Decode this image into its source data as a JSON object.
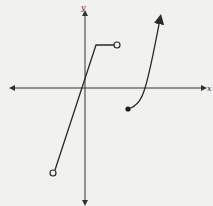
{
  "graph": {
    "axes": {
      "x_label": "x",
      "y_label": "y",
      "color": "#333333"
    },
    "curve_color": "#2a2a2a",
    "pieces": [
      {
        "name": "linear-segment",
        "description": "rising line from open circle (bottom-left) to corner, then horizontal segment ending at open circle",
        "start_point": {
          "type": "open",
          "px": [
            53,
            173
          ]
        },
        "corner_px": [
          96,
          45
        ],
        "end_point": {
          "type": "open",
          "px": [
            117,
            45
          ]
        }
      },
      {
        "name": "curve-segment",
        "description": "increasing curve starting at closed dot below x-axis, crossing x-axis, continuing upward with arrow",
        "start_point": {
          "type": "closed",
          "px": [
            128,
            109
          ]
        },
        "x_intercept_px": [
          145,
          88
        ],
        "end_arrow_px": [
          161,
          17
        ]
      }
    ]
  }
}
